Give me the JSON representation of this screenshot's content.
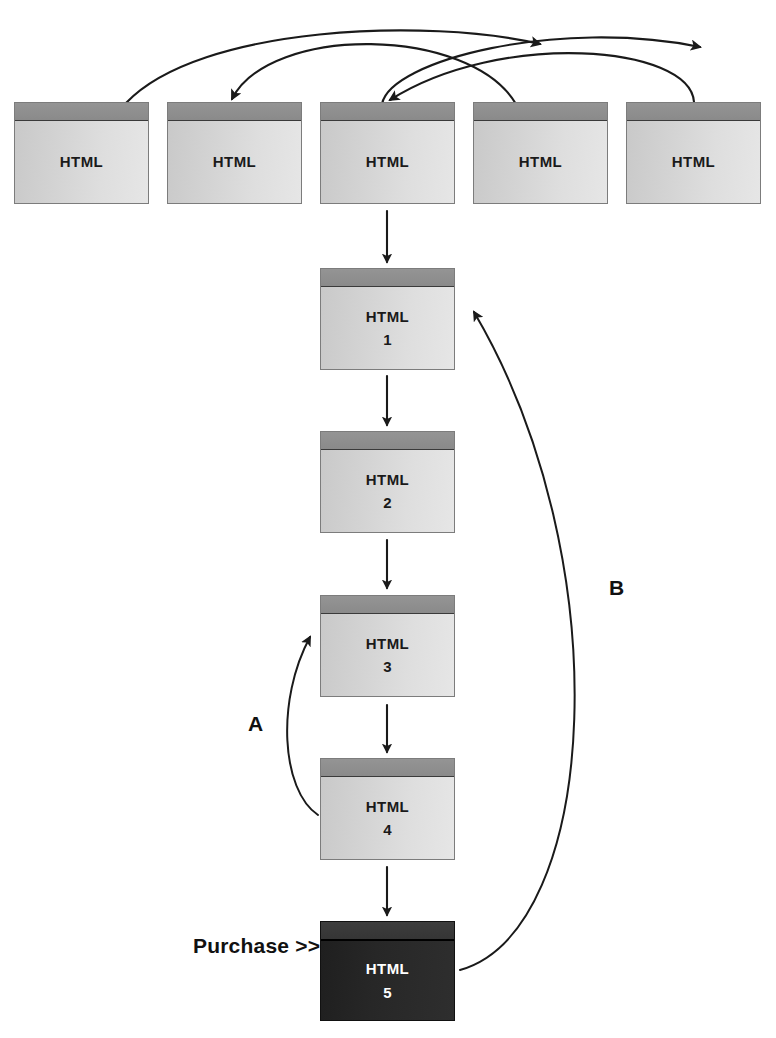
{
  "diagram": {
    "colors": {
      "page_fill_light": "#d9d9d9",
      "page_titlebar": "#8e8e8e",
      "page_border": "#7c7c7c",
      "page_fill_dark": "#262626",
      "arrow_stroke": "#1a1a1a",
      "text": "#111111",
      "text_on_dark": "#ffffff",
      "background": "#ffffff"
    },
    "top_row": {
      "name": "entry-pages-row",
      "pages": [
        {
          "label": "HTML",
          "number": ""
        },
        {
          "label": "HTML",
          "number": ""
        },
        {
          "label": "HTML",
          "number": ""
        },
        {
          "label": "HTML",
          "number": ""
        },
        {
          "label": "HTML",
          "number": ""
        }
      ]
    },
    "funnel": {
      "name": "conversion-funnel-column",
      "pages": [
        {
          "label": "HTML",
          "number": "1",
          "dark": false
        },
        {
          "label": "HTML",
          "number": "2",
          "dark": false
        },
        {
          "label": "HTML",
          "number": "3",
          "dark": false
        },
        {
          "label": "HTML",
          "number": "4",
          "dark": false
        },
        {
          "label": "HTML",
          "number": "5",
          "dark": true
        }
      ]
    },
    "captions": {
      "purchase": "Purchase >>",
      "loop_a": "A",
      "loop_b": "B"
    },
    "arrows": {
      "cross_links_count": 4,
      "funnel_steps_count": 5,
      "back_loop_a": "from HTML 4 back up to HTML 3",
      "back_loop_b": "from HTML 5 back up to HTML 1"
    }
  }
}
